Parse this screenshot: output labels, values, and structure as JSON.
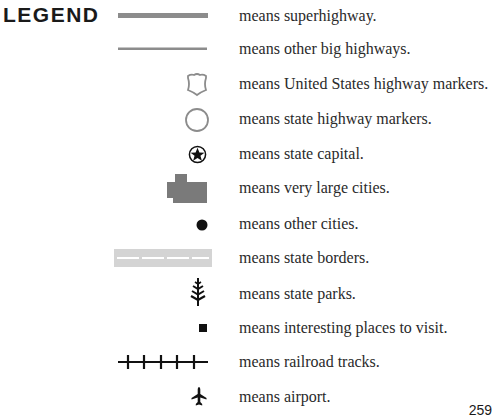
{
  "legend": {
    "title": "LEGEND",
    "items": [
      {
        "symbol": "superhighway-line-icon",
        "label": "means superhighway."
      },
      {
        "symbol": "highway-line-icon",
        "label": "means other big highways."
      },
      {
        "symbol": "us-highway-shield-icon",
        "label": "means United States highway markers."
      },
      {
        "symbol": "state-highway-circle-icon",
        "label": "means state highway markers."
      },
      {
        "symbol": "star-in-circle-icon",
        "label": "means state capital."
      },
      {
        "symbol": "large-city-block-icon",
        "label": "means very large cities."
      },
      {
        "symbol": "dot-icon",
        "label": "means other cities."
      },
      {
        "symbol": "dashed-border-icon",
        "label": "means state borders."
      },
      {
        "symbol": "tree-icon",
        "label": "means state parks."
      },
      {
        "symbol": "square-icon",
        "label": "means interesting places to visit."
      },
      {
        "symbol": "railroad-track-icon",
        "label": "means railroad tracks."
      },
      {
        "symbol": "airplane-icon",
        "label": "means airport."
      }
    ]
  },
  "page_number": "259",
  "colors": {
    "highway_gray": "#8c8c8c",
    "city_gray": "#7a7a7a",
    "border_gray": "#d4d4d4",
    "ink": "#111111"
  }
}
